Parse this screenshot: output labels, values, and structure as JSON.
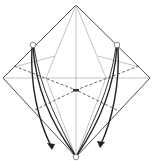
{
  "diagram": {
    "type": "origami-fold-diagram",
    "colors": {
      "background": "#ffffff",
      "outline": "#3a3a3a",
      "crease": "#9a9a9a",
      "arrow": "#222222"
    },
    "points": {
      "top": [
        76,
        5
      ],
      "left": [
        3,
        78
      ],
      "right": [
        150,
        78
      ],
      "bottom": [
        76,
        157
      ],
      "center": [
        76,
        90
      ],
      "left_mark": [
        33,
        45
      ],
      "right_mark": [
        117,
        45
      ]
    },
    "markers": [
      "left-reference-circle",
      "right-reference-circle",
      "bottom-target-circle"
    ],
    "arrows": [
      {
        "name": "left-fold-arrow",
        "from": "left_mark",
        "to": "bottom"
      },
      {
        "name": "left-fold-arrow-outer",
        "from": "left_mark",
        "to": [
          52,
          148
        ]
      },
      {
        "name": "right-fold-arrow",
        "from": "right_mark",
        "to": "bottom"
      },
      {
        "name": "right-fold-arrow-outer",
        "from": "right_mark",
        "to": [
          101,
          146
        ]
      }
    ]
  }
}
